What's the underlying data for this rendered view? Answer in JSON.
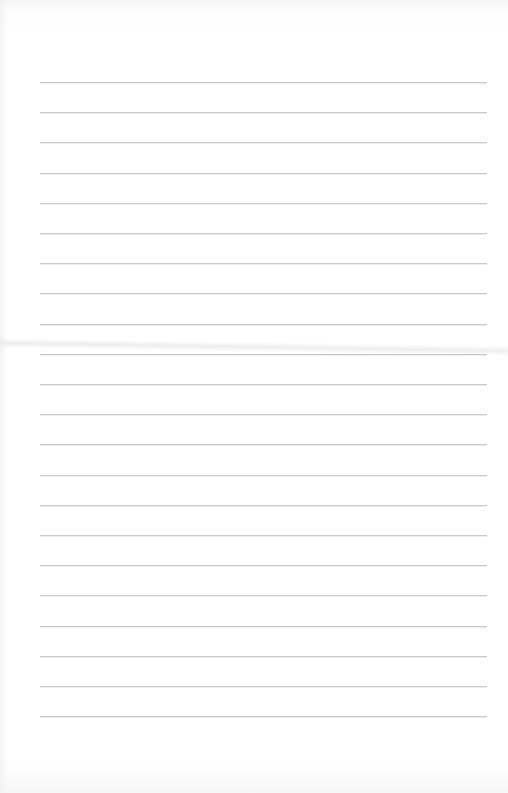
{
  "document": {
    "type": "lined-paper",
    "background_color": "#ffffff",
    "rule_color": "#c9c9c9",
    "rule_left_px": 40,
    "rule_right_px": 487,
    "rule_count": 22,
    "first_rule_y_px": 82,
    "rule_spacing_px": 30.2,
    "text": ""
  }
}
